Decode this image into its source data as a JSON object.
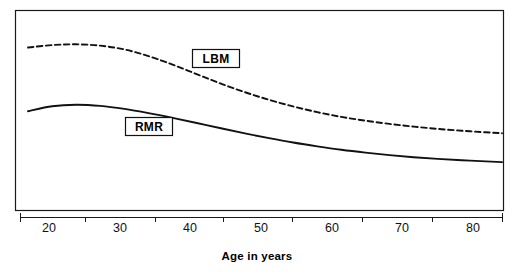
{
  "chart_data": {
    "type": "line",
    "title": "",
    "subtitle": "",
    "xlabel": "Age in years",
    "ylabel": "",
    "xlim": [
      20,
      80
    ],
    "ylim": [
      0,
      100
    ],
    "grid": false,
    "legend_position": "inline-boxed-labels",
    "xticks": [
      20,
      30,
      40,
      50,
      60,
      70,
      80
    ],
    "xtick_labels": [
      "20",
      "30",
      "40",
      "50",
      "60",
      "70",
      "80"
    ],
    "ytick_labels": [],
    "annotations": [
      {
        "text": "LBM",
        "x": 44,
        "y": 78,
        "boxed": true
      },
      {
        "text": "RMR",
        "x": 35,
        "y": 45,
        "boxed": true
      }
    ],
    "series": [
      {
        "name": "LBM",
        "style": "dashed",
        "color": "#111111",
        "x": [
          21,
          24,
          27,
          30,
          33,
          36,
          39,
          42,
          45,
          48,
          51,
          54,
          57,
          60,
          63,
          66,
          69,
          72,
          75,
          78,
          80
        ],
        "values": [
          85.5,
          86.8,
          87.2,
          86.5,
          84.5,
          81.0,
          76.5,
          71.5,
          66.5,
          62.0,
          58.0,
          54.5,
          51.5,
          49.0,
          47.0,
          45.3,
          43.9,
          42.7,
          41.7,
          40.9,
          40.4
        ]
      },
      {
        "name": "RMR",
        "style": "solid",
        "color": "#111111",
        "x": [
          21,
          24,
          27,
          30,
          33,
          36,
          39,
          42,
          45,
          48,
          51,
          54,
          57,
          60,
          63,
          66,
          69,
          72,
          75,
          78,
          80
        ],
        "values": [
          52.0,
          54.6,
          55.4,
          54.8,
          53.2,
          51.0,
          48.5,
          45.8,
          43.0,
          40.3,
          37.8,
          35.5,
          33.5,
          31.7,
          30.2,
          28.9,
          27.8,
          26.9,
          26.2,
          25.6,
          25.2
        ]
      }
    ]
  },
  "axis": {
    "x_title": "Age in years",
    "tick_labels": [
      "20",
      "30",
      "40",
      "50",
      "60",
      "70",
      "80"
    ]
  },
  "labels": {
    "lbm": "LBM",
    "rmr": "RMR"
  },
  "colors": {
    "ink": "#111111",
    "frame": "#1a1a1a",
    "background": "#ffffff"
  }
}
